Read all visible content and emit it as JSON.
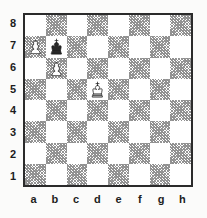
{
  "diagram": {
    "type": "chess-board-diagram",
    "orientation": "white-bottom",
    "colors": {
      "background": "#fbfbfa",
      "light_square": "#ffffff",
      "dark_square_hatch": "#8f8f8f",
      "border": "#2b2b2b",
      "label_text": "#1d1d1d"
    },
    "rank_labels": [
      "8",
      "7",
      "6",
      "5",
      "4",
      "3",
      "2",
      "1"
    ],
    "file_labels": [
      "a",
      "b",
      "c",
      "d",
      "e",
      "f",
      "g",
      "h"
    ],
    "squares": [
      {
        "id": "a8",
        "shade": "light",
        "piece": null
      },
      {
        "id": "b8",
        "shade": "dark",
        "piece": null
      },
      {
        "id": "c8",
        "shade": "light",
        "piece": null
      },
      {
        "id": "d8",
        "shade": "dark",
        "piece": null
      },
      {
        "id": "e8",
        "shade": "light",
        "piece": null
      },
      {
        "id": "f8",
        "shade": "dark",
        "piece": null
      },
      {
        "id": "g8",
        "shade": "light",
        "piece": null
      },
      {
        "id": "h8",
        "shade": "dark",
        "piece": null
      },
      {
        "id": "a7",
        "shade": "dark",
        "piece": "white-pawn"
      },
      {
        "id": "b7",
        "shade": "light",
        "piece": "black-king"
      },
      {
        "id": "c7",
        "shade": "dark",
        "piece": null
      },
      {
        "id": "d7",
        "shade": "light",
        "piece": null
      },
      {
        "id": "e7",
        "shade": "dark",
        "piece": null
      },
      {
        "id": "f7",
        "shade": "light",
        "piece": null
      },
      {
        "id": "g7",
        "shade": "dark",
        "piece": null
      },
      {
        "id": "h7",
        "shade": "light",
        "piece": null
      },
      {
        "id": "a6",
        "shade": "light",
        "piece": null
      },
      {
        "id": "b6",
        "shade": "dark",
        "piece": "white-pawn"
      },
      {
        "id": "c6",
        "shade": "light",
        "piece": null
      },
      {
        "id": "d6",
        "shade": "dark",
        "piece": null
      },
      {
        "id": "e6",
        "shade": "light",
        "piece": null
      },
      {
        "id": "f6",
        "shade": "dark",
        "piece": null
      },
      {
        "id": "g6",
        "shade": "light",
        "piece": null
      },
      {
        "id": "h6",
        "shade": "dark",
        "piece": null
      },
      {
        "id": "a5",
        "shade": "dark",
        "piece": null
      },
      {
        "id": "b5",
        "shade": "light",
        "piece": null
      },
      {
        "id": "c5",
        "shade": "dark",
        "piece": null
      },
      {
        "id": "d5",
        "shade": "light",
        "piece": "white-king"
      },
      {
        "id": "e5",
        "shade": "dark",
        "piece": null
      },
      {
        "id": "f5",
        "shade": "light",
        "piece": null
      },
      {
        "id": "g5",
        "shade": "dark",
        "piece": null
      },
      {
        "id": "h5",
        "shade": "light",
        "piece": null
      },
      {
        "id": "a4",
        "shade": "light",
        "piece": null
      },
      {
        "id": "b4",
        "shade": "dark",
        "piece": null
      },
      {
        "id": "c4",
        "shade": "light",
        "piece": null
      },
      {
        "id": "d4",
        "shade": "dark",
        "piece": null
      },
      {
        "id": "e4",
        "shade": "light",
        "piece": null
      },
      {
        "id": "f4",
        "shade": "dark",
        "piece": null
      },
      {
        "id": "g4",
        "shade": "light",
        "piece": null
      },
      {
        "id": "h4",
        "shade": "dark",
        "piece": null
      },
      {
        "id": "a3",
        "shade": "dark",
        "piece": null
      },
      {
        "id": "b3",
        "shade": "light",
        "piece": null
      },
      {
        "id": "c3",
        "shade": "dark",
        "piece": null
      },
      {
        "id": "d3",
        "shade": "light",
        "piece": null
      },
      {
        "id": "e3",
        "shade": "dark",
        "piece": null
      },
      {
        "id": "f3",
        "shade": "light",
        "piece": null
      },
      {
        "id": "g3",
        "shade": "dark",
        "piece": null
      },
      {
        "id": "h3",
        "shade": "light",
        "piece": null
      },
      {
        "id": "a2",
        "shade": "light",
        "piece": null
      },
      {
        "id": "b2",
        "shade": "dark",
        "piece": null
      },
      {
        "id": "c2",
        "shade": "light",
        "piece": null
      },
      {
        "id": "d2",
        "shade": "dark",
        "piece": null
      },
      {
        "id": "e2",
        "shade": "light",
        "piece": null
      },
      {
        "id": "f2",
        "shade": "dark",
        "piece": null
      },
      {
        "id": "g2",
        "shade": "light",
        "piece": null
      },
      {
        "id": "h2",
        "shade": "dark",
        "piece": null
      },
      {
        "id": "a1",
        "shade": "dark",
        "piece": null
      },
      {
        "id": "b1",
        "shade": "light",
        "piece": null
      },
      {
        "id": "c1",
        "shade": "dark",
        "piece": null
      },
      {
        "id": "d1",
        "shade": "light",
        "piece": null
      },
      {
        "id": "e1",
        "shade": "dark",
        "piece": null
      },
      {
        "id": "f1",
        "shade": "light",
        "piece": null
      },
      {
        "id": "g1",
        "shade": "dark",
        "piece": null
      },
      {
        "id": "h1",
        "shade": "light",
        "piece": null
      }
    ],
    "pieces_placed": [
      {
        "square": "a7",
        "piece": "white-pawn"
      },
      {
        "square": "b7",
        "piece": "black-king"
      },
      {
        "square": "b6",
        "piece": "white-pawn"
      },
      {
        "square": "d5",
        "piece": "white-king"
      }
    ]
  }
}
